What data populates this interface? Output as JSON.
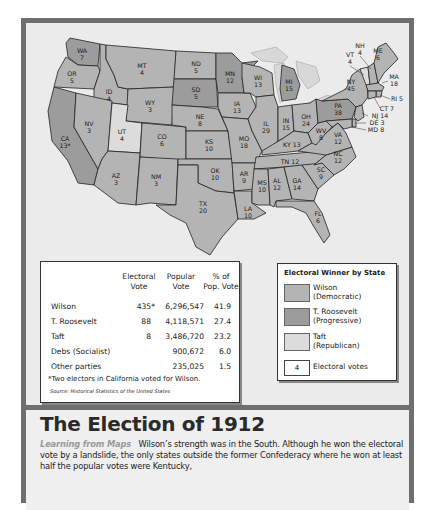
{
  "colors": {
    "wilson": "#b4b4b4",
    "roosevelt": "#9c9c9c",
    "taft": "#dcdcdc",
    "water": "#ebebeb",
    "lakes": "#d8d8d8",
    "frame": "#6e6e6e"
  },
  "map": {
    "states": [
      {
        "abbr": "WA",
        "ev": "7",
        "winner": "roosevelt"
      },
      {
        "abbr": "OR",
        "ev": "5",
        "winner": "wilson"
      },
      {
        "abbr": "CA",
        "ev": "13*",
        "winner": "roosevelt"
      },
      {
        "abbr": "ID",
        "ev": "4",
        "winner": "wilson"
      },
      {
        "abbr": "NV",
        "ev": "3",
        "winner": "wilson"
      },
      {
        "abbr": "MT",
        "ev": "4",
        "winner": "wilson"
      },
      {
        "abbr": "WY",
        "ev": "3",
        "winner": "wilson"
      },
      {
        "abbr": "UT",
        "ev": "4",
        "winner": "taft"
      },
      {
        "abbr": "AZ",
        "ev": "3",
        "winner": "wilson"
      },
      {
        "abbr": "CO",
        "ev": "6",
        "winner": "wilson"
      },
      {
        "abbr": "NM",
        "ev": "3",
        "winner": "wilson"
      },
      {
        "abbr": "ND",
        "ev": "5",
        "winner": "wilson"
      },
      {
        "abbr": "SD",
        "ev": "5",
        "winner": "roosevelt"
      },
      {
        "abbr": "NE",
        "ev": "8",
        "winner": "wilson"
      },
      {
        "abbr": "KS",
        "ev": "10",
        "winner": "wilson"
      },
      {
        "abbr": "OK",
        "ev": "10",
        "winner": "wilson"
      },
      {
        "abbr": "TX",
        "ev": "20",
        "winner": "wilson"
      },
      {
        "abbr": "MN",
        "ev": "12",
        "winner": "roosevelt"
      },
      {
        "abbr": "IA",
        "ev": "13",
        "winner": "wilson"
      },
      {
        "abbr": "MO",
        "ev": "18",
        "winner": "wilson"
      },
      {
        "abbr": "AR",
        "ev": "9",
        "winner": "wilson"
      },
      {
        "abbr": "LA",
        "ev": "10",
        "winner": "wilson"
      },
      {
        "abbr": "WI",
        "ev": "13",
        "winner": "wilson"
      },
      {
        "abbr": "IL",
        "ev": "29",
        "winner": "wilson"
      },
      {
        "abbr": "MI",
        "ev": "15",
        "winner": "roosevelt"
      },
      {
        "abbr": "IN",
        "ev": "15",
        "winner": "wilson"
      },
      {
        "abbr": "OH",
        "ev": "24",
        "winner": "wilson"
      },
      {
        "abbr": "KY",
        "ev": "13",
        "winner": "wilson"
      },
      {
        "abbr": "TN",
        "ev": "12",
        "winner": "wilson"
      },
      {
        "abbr": "MS",
        "ev": "10",
        "winner": "wilson"
      },
      {
        "abbr": "AL",
        "ev": "12",
        "winner": "wilson"
      },
      {
        "abbr": "GA",
        "ev": "14",
        "winner": "wilson"
      },
      {
        "abbr": "FL",
        "ev": "6",
        "winner": "wilson"
      },
      {
        "abbr": "SC",
        "ev": "9",
        "winner": "wilson"
      },
      {
        "abbr": "NC",
        "ev": "12",
        "winner": "wilson"
      },
      {
        "abbr": "VA",
        "ev": "12",
        "winner": "wilson"
      },
      {
        "abbr": "WV",
        "ev": "8",
        "winner": "wilson"
      },
      {
        "abbr": "PA",
        "ev": "38",
        "winner": "roosevelt"
      },
      {
        "abbr": "NY",
        "ev": "45",
        "winner": "wilson"
      },
      {
        "abbr": "VT",
        "ev": "4",
        "winner": "taft"
      },
      {
        "abbr": "NH",
        "ev": "4",
        "winner": "wilson"
      },
      {
        "abbr": "ME",
        "ev": "6",
        "winner": "wilson"
      },
      {
        "abbr": "MA",
        "ev": "18",
        "winner": "wilson"
      },
      {
        "abbr": "RI",
        "ev": "5",
        "winner": "wilson"
      },
      {
        "abbr": "CT",
        "ev": "7",
        "winner": "wilson"
      },
      {
        "abbr": "NJ",
        "ev": "14",
        "winner": "wilson"
      },
      {
        "abbr": "DE",
        "ev": "3",
        "winner": "wilson"
      },
      {
        "abbr": "MD",
        "ev": "8",
        "winner": "wilson"
      }
    ]
  },
  "results_table": {
    "headers": {
      "electoral": [
        "Electoral",
        "Vote"
      ],
      "popular": [
        "Popular",
        "Vote"
      ],
      "percent": [
        "% of",
        "Pop. Vote"
      ]
    },
    "rows": [
      {
        "candidate": "Wilson",
        "electoral": "435*",
        "popular": "6,296,547",
        "percent": "41.9"
      },
      {
        "candidate": "T. Roosevelt",
        "electoral": "88",
        "popular": "4,118,571",
        "percent": "27.4"
      },
      {
        "candidate": "Taft",
        "electoral": "8",
        "popular": "3,486,720",
        "percent": "23.2"
      },
      {
        "candidate": "Debs (Socialist)",
        "electoral": "",
        "popular": "900,672",
        "percent": "6.0"
      },
      {
        "candidate": "Other parties",
        "electoral": "",
        "popular": "235,025",
        "percent": "1.5"
      }
    ],
    "footnote": "*Two electors in California voted for Wilson.",
    "source_label": "Source:",
    "source": "Historical Statistics of the United States"
  },
  "legend": {
    "title": "Electoral Winner by State",
    "items": [
      {
        "name": "Wilson",
        "party": "(Democratic)",
        "color": "#b4b4b4"
      },
      {
        "name": "T. Roosevelt",
        "party": "(Progressive)",
        "color": "#9c9c9c"
      },
      {
        "name": "Taft",
        "party": "(Republican)",
        "color": "#dcdcdc"
      }
    ],
    "ev_sample": "4",
    "ev_label": "Electoral votes"
  },
  "caption": {
    "title": "The Election of 1912",
    "lead": "Learning from Maps",
    "text": "Wilson’s strength was in the South. Although he won the electoral vote by a landslide, the only states outside the former Confederacy where he won at least half the popular votes were Kentucky,"
  }
}
